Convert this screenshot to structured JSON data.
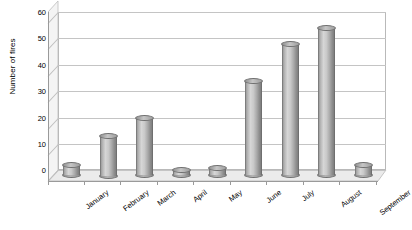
{
  "chart_data": {
    "type": "bar",
    "title": "",
    "subtitle": "",
    "xlabel": "",
    "ylabel": "Number of fires",
    "categories": [
      "January",
      "February",
      "March",
      "April",
      "May",
      "June",
      "July",
      "August",
      "September"
    ],
    "values": [
      4,
      15,
      22,
      2,
      3,
      36,
      50,
      56,
      4
    ],
    "series": [
      {
        "name": "Number of fires",
        "values": [
          4,
          15,
          22,
          2,
          3,
          36,
          50,
          56,
          4
        ]
      }
    ],
    "ylim": [
      0,
      60
    ],
    "ytick_labels": [
      "0",
      "10",
      "20",
      "30",
      "40",
      "50",
      "60"
    ],
    "ytick_values": [
      0,
      10,
      20,
      30,
      40,
      50,
      60
    ],
    "grid": true,
    "legend": false,
    "legend_position": "none",
    "style": "3d-cylinder",
    "bar_color": "#b0b0b0",
    "gridline_color": "#c4c4c4",
    "axis_color": "#9a9a9a",
    "background_color": "#ffffff",
    "annotations": []
  }
}
